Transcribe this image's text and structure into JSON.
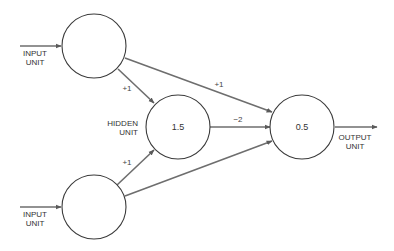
{
  "diagram": {
    "type": "neural-network",
    "colors": {
      "node_stroke": "#3a3a3a",
      "edge": "#6e6e6e",
      "text": "#333333",
      "background": "#ffffff"
    },
    "nodes": [
      {
        "id": "input1",
        "label_line1": "INPUT",
        "label_line2": "UNIT",
        "value": ""
      },
      {
        "id": "input2",
        "label_line1": "INPUT",
        "label_line2": "UNIT",
        "value": ""
      },
      {
        "id": "hidden",
        "label_line1": "HIDDEN",
        "label_line2": "UNIT",
        "value": "1.5"
      },
      {
        "id": "output",
        "label_line1": "OUTPUT",
        "label_line2": "UNIT",
        "value": "0.5"
      }
    ],
    "edges": [
      {
        "from": "input1",
        "to": "hidden",
        "weight": "+1"
      },
      {
        "from": "input2",
        "to": "hidden",
        "weight": "+1"
      },
      {
        "from": "input1",
        "to": "output",
        "weight": "+1"
      },
      {
        "from": "hidden",
        "to": "output",
        "weight": "−2"
      },
      {
        "from": "input2",
        "to": "output",
        "weight": ""
      }
    ]
  }
}
